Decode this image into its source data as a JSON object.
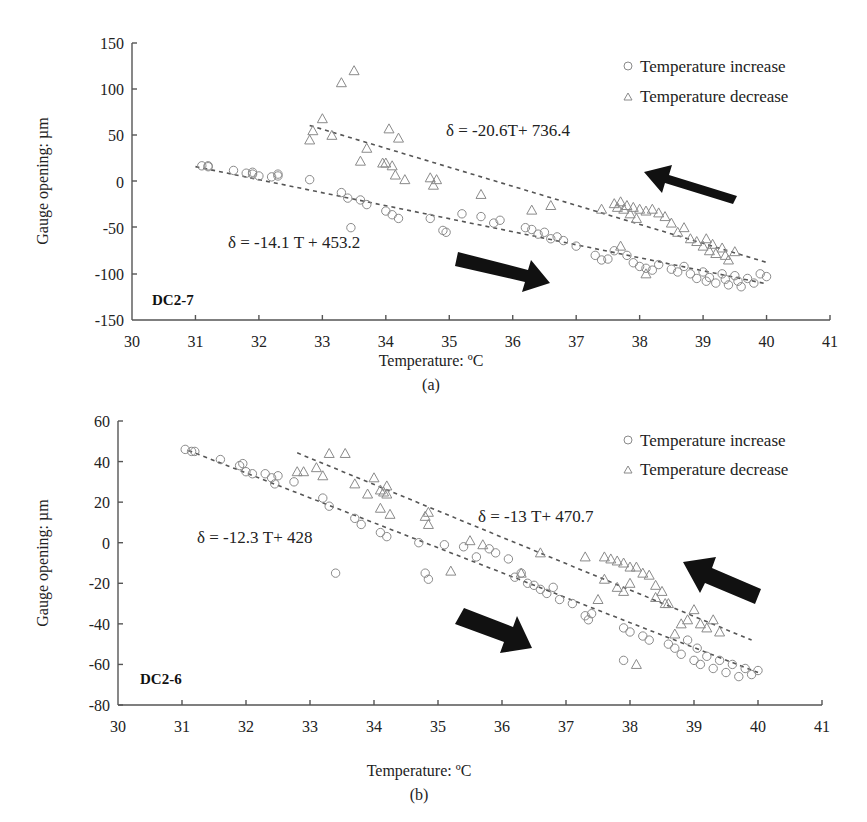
{
  "chart_data": [
    {
      "type": "scatter",
      "panel": "(a)",
      "panel_label": "DC2-7",
      "title": "",
      "xlabel": "Temperature: ºC",
      "ylabel": "Gauge opening: µm",
      "xlim": [
        30,
        41
      ],
      "ylim": [
        -150,
        150
      ],
      "x_ticks": [
        30,
        31,
        32,
        33,
        34,
        35,
        36,
        37,
        38,
        39,
        40,
        41
      ],
      "y_ticks": [
        150,
        100,
        50,
        0,
        -50,
        -100,
        -150
      ],
      "grid": false,
      "legend": {
        "position": "top-right",
        "entries": [
          "Temperature increase",
          "Temperature decrease"
        ]
      },
      "series": [
        {
          "name": "Temperature increase",
          "marker": "circle",
          "trendline": {
            "equation": "δ = -14.1 T + 453.2",
            "slope": -14.1,
            "intercept": 453.2,
            "x_range": [
              31,
              40
            ]
          },
          "points": [
            [
              31.1,
              17
            ],
            [
              31.2,
              16
            ],
            [
              31.2,
              17
            ],
            [
              31.6,
              12
            ],
            [
              31.8,
              9
            ],
            [
              31.9,
              8
            ],
            [
              31.9,
              10
            ],
            [
              32.0,
              6
            ],
            [
              32.2,
              5
            ],
            [
              32.3,
              6
            ],
            [
              32.3,
              8
            ],
            [
              32.8,
              2
            ],
            [
              33.3,
              -12
            ],
            [
              33.4,
              -18
            ],
            [
              33.45,
              -50
            ],
            [
              33.6,
              -20
            ],
            [
              33.7,
              -25
            ],
            [
              34.0,
              -32
            ],
            [
              34.1,
              -36
            ],
            [
              34.2,
              -40
            ],
            [
              34.7,
              -40
            ],
            [
              34.9,
              -53
            ],
            [
              34.95,
              -55
            ],
            [
              35.2,
              -35
            ],
            [
              35.5,
              -38
            ],
            [
              35.7,
              -45
            ],
            [
              35.8,
              -42
            ],
            [
              36.2,
              -50
            ],
            [
              36.3,
              -52
            ],
            [
              36.4,
              -57
            ],
            [
              36.5,
              -55
            ],
            [
              36.6,
              -62
            ],
            [
              36.7,
              -60
            ],
            [
              36.8,
              -64
            ],
            [
              37.0,
              -70
            ],
            [
              37.3,
              -80
            ],
            [
              37.4,
              -85
            ],
            [
              37.5,
              -84
            ],
            [
              37.6,
              -75
            ],
            [
              37.8,
              -80
            ],
            [
              37.9,
              -88
            ],
            [
              38.0,
              -92
            ],
            [
              38.1,
              -94
            ],
            [
              38.2,
              -96
            ],
            [
              38.3,
              -90
            ],
            [
              38.5,
              -95
            ],
            [
              38.6,
              -98
            ],
            [
              38.7,
              -92
            ],
            [
              38.8,
              -100
            ],
            [
              38.9,
              -105
            ],
            [
              39.0,
              -98
            ],
            [
              39.05,
              -108
            ],
            [
              39.1,
              -104
            ],
            [
              39.2,
              -110
            ],
            [
              39.3,
              -100
            ],
            [
              39.35,
              -106
            ],
            [
              39.4,
              -112
            ],
            [
              39.5,
              -102
            ],
            [
              39.55,
              -108
            ],
            [
              39.6,
              -114
            ],
            [
              39.7,
              -105
            ],
            [
              39.8,
              -110
            ],
            [
              39.9,
              -100
            ],
            [
              40.0,
              -103
            ]
          ]
        },
        {
          "name": "Temperature decrease",
          "marker": "triangle",
          "trendline": {
            "equation": "δ = -20.6T+ 736.4",
            "slope": -20.6,
            "intercept": 736.4,
            "x_range": [
              32.8,
              40
            ]
          },
          "points": [
            [
              32.8,
              45
            ],
            [
              32.85,
              55
            ],
            [
              33.0,
              68
            ],
            [
              33.15,
              50
            ],
            [
              33.3,
              107
            ],
            [
              33.5,
              120
            ],
            [
              33.6,
              22
            ],
            [
              33.7,
              36
            ],
            [
              33.95,
              20
            ],
            [
              34.0,
              20
            ],
            [
              34.05,
              57
            ],
            [
              34.1,
              17
            ],
            [
              34.15,
              7
            ],
            [
              34.2,
              47
            ],
            [
              34.3,
              2
            ],
            [
              34.7,
              4
            ],
            [
              34.75,
              -4
            ],
            [
              34.8,
              2
            ],
            [
              35.5,
              -14
            ],
            [
              36.3,
              -31
            ],
            [
              36.6,
              -26
            ],
            [
              37.4,
              -30
            ],
            [
              37.6,
              -24
            ],
            [
              37.65,
              -28
            ],
            [
              37.7,
              -22
            ],
            [
              37.75,
              -30
            ],
            [
              37.8,
              -26
            ],
            [
              37.85,
              -35
            ],
            [
              37.9,
              -28
            ],
            [
              37.95,
              -40
            ],
            [
              38.0,
              -30
            ],
            [
              38.1,
              -32
            ],
            [
              38.2,
              -30
            ],
            [
              38.3,
              -34
            ],
            [
              38.4,
              -38
            ],
            [
              38.5,
              -45
            ],
            [
              38.6,
              -55
            ],
            [
              38.7,
              -50
            ],
            [
              38.8,
              -62
            ],
            [
              38.9,
              -65
            ],
            [
              39.0,
              -70
            ],
            [
              39.05,
              -62
            ],
            [
              39.1,
              -75
            ],
            [
              39.15,
              -68
            ],
            [
              39.2,
              -78
            ],
            [
              39.3,
              -72
            ],
            [
              39.35,
              -80
            ],
            [
              39.4,
              -85
            ],
            [
              39.5,
              -76
            ],
            [
              37.7,
              -70
            ],
            [
              38.1,
              -100
            ]
          ]
        }
      ],
      "annotations": [
        "δ = -20.6T+ 736.4",
        "δ = -14.1 T + 453.2",
        "DC2-7",
        "arrow right (heating)",
        "arrow left (cooling)"
      ]
    },
    {
      "type": "scatter",
      "panel": "(b)",
      "panel_label": "DC2-6",
      "title": "",
      "xlabel": "Temperature: ºC",
      "ylabel": "Gauge opening: µm",
      "xlim": [
        30,
        41
      ],
      "ylim": [
        -80,
        60
      ],
      "x_ticks": [
        30,
        31,
        32,
        33,
        34,
        35,
        36,
        37,
        38,
        39,
        40,
        41
      ],
      "y_ticks": [
        60,
        40,
        20,
        0,
        -20,
        -40,
        -60,
        -80
      ],
      "grid": false,
      "legend": {
        "position": "top-right",
        "entries": [
          "Temperature increase",
          "Temperature decrease"
        ]
      },
      "series": [
        {
          "name": "Temperature increase",
          "marker": "circle",
          "trendline": {
            "equation": "δ = -12.3 T+ 428",
            "slope": -12.3,
            "intercept": 428,
            "x_range": [
              31.1,
              40
            ]
          },
          "points": [
            [
              31.05,
              46
            ],
            [
              31.15,
              45
            ],
            [
              31.2,
              45
            ],
            [
              31.6,
              41
            ],
            [
              31.9,
              38
            ],
            [
              31.95,
              39
            ],
            [
              32.0,
              35
            ],
            [
              32.1,
              34
            ],
            [
              32.3,
              34
            ],
            [
              32.4,
              32
            ],
            [
              32.45,
              29
            ],
            [
              32.5,
              33
            ],
            [
              32.75,
              30
            ],
            [
              33.2,
              22
            ],
            [
              33.3,
              18
            ],
            [
              33.4,
              -15
            ],
            [
              33.7,
              12
            ],
            [
              33.8,
              9
            ],
            [
              34.1,
              5
            ],
            [
              34.2,
              3
            ],
            [
              34.7,
              0
            ],
            [
              34.8,
              -15
            ],
            [
              34.85,
              -18
            ],
            [
              35.1,
              -1
            ],
            [
              35.4,
              -2
            ],
            [
              35.6,
              -7
            ],
            [
              35.8,
              -3
            ],
            [
              35.9,
              -5
            ],
            [
              36.1,
              -8
            ],
            [
              36.2,
              -17
            ],
            [
              36.3,
              -15
            ],
            [
              36.4,
              -20
            ],
            [
              36.5,
              -21
            ],
            [
              36.6,
              -23
            ],
            [
              36.7,
              -25
            ],
            [
              36.8,
              -22
            ],
            [
              36.9,
              -28
            ],
            [
              37.1,
              -30
            ],
            [
              37.3,
              -36
            ],
            [
              37.35,
              -38
            ],
            [
              37.4,
              -35
            ],
            [
              37.9,
              -42
            ],
            [
              38.0,
              -44
            ],
            [
              38.2,
              -46
            ],
            [
              38.3,
              -48
            ],
            [
              38.6,
              -50
            ],
            [
              38.7,
              -52
            ],
            [
              38.8,
              -55
            ],
            [
              38.9,
              -48
            ],
            [
              39.0,
              -58
            ],
            [
              39.05,
              -52
            ],
            [
              39.1,
              -60
            ],
            [
              39.2,
              -56
            ],
            [
              39.3,
              -62
            ],
            [
              39.4,
              -58
            ],
            [
              39.5,
              -64
            ],
            [
              39.6,
              -60
            ],
            [
              39.7,
              -66
            ],
            [
              39.8,
              -62
            ],
            [
              39.9,
              -65
            ],
            [
              40.0,
              -63
            ],
            [
              37.9,
              -58
            ]
          ]
        },
        {
          "name": "Temperature decrease",
          "marker": "triangle",
          "trendline": {
            "equation": "δ = -13 T+ 470.7",
            "slope": -13,
            "intercept": 470.7,
            "x_range": [
              32.8,
              39.9
            ]
          },
          "points": [
            [
              32.8,
              35
            ],
            [
              32.9,
              35
            ],
            [
              33.1,
              37
            ],
            [
              33.2,
              33
            ],
            [
              33.3,
              44
            ],
            [
              33.55,
              44
            ],
            [
              33.7,
              29
            ],
            [
              33.9,
              24
            ],
            [
              34.0,
              32
            ],
            [
              34.1,
              26
            ],
            [
              34.15,
              25
            ],
            [
              34.2,
              24
            ],
            [
              34.2,
              28
            ],
            [
              34.1,
              17
            ],
            [
              34.25,
              14
            ],
            [
              34.8,
              13
            ],
            [
              34.85,
              9
            ],
            [
              34.85,
              15
            ],
            [
              35.2,
              -14
            ],
            [
              35.5,
              1
            ],
            [
              35.7,
              -1
            ],
            [
              36.3,
              -15
            ],
            [
              36.6,
              -5
            ],
            [
              37.3,
              -7
            ],
            [
              37.6,
              -7
            ],
            [
              37.7,
              -8
            ],
            [
              37.8,
              -9
            ],
            [
              37.9,
              -10
            ],
            [
              38.0,
              -12
            ],
            [
              38.1,
              -12
            ],
            [
              38.2,
              -15
            ],
            [
              38.3,
              -16
            ],
            [
              38.4,
              -21
            ],
            [
              38.5,
              -24
            ],
            [
              38.55,
              -30
            ],
            [
              37.6,
              -18
            ],
            [
              37.8,
              -22
            ],
            [
              37.9,
              -24
            ],
            [
              38.0,
              -20
            ],
            [
              38.7,
              -45
            ],
            [
              38.8,
              -40
            ],
            [
              38.9,
              -38
            ],
            [
              39.0,
              -33
            ],
            [
              39.1,
              -40
            ],
            [
              39.2,
              -42
            ],
            [
              39.3,
              -38
            ],
            [
              39.4,
              -44
            ],
            [
              38.4,
              -27
            ],
            [
              38.6,
              -30
            ],
            [
              38.1,
              -60
            ],
            [
              37.5,
              -28
            ]
          ]
        }
      ],
      "annotations": [
        "δ = -13 T+ 470.7",
        "δ = -12.3 T+ 428",
        "DC2-6",
        "arrow right (heating)",
        "arrow left (cooling)"
      ]
    }
  ],
  "chart_a": {
    "caption": "(a)",
    "panel_label": "DC2-7",
    "xlabel": "Temperature: ºC",
    "ylabel": "Gauge opening: µm",
    "eq_decrease": "δ = -20.6T+ 736.4",
    "eq_increase": "δ = -14.1 T + 453.2",
    "legend_increase": "Temperature increase",
    "legend_decrease": "Temperature decrease",
    "x_ticks": [
      "30",
      "31",
      "32",
      "33",
      "34",
      "35",
      "36",
      "37",
      "38",
      "39",
      "40",
      "41"
    ],
    "y_ticks": [
      "150",
      "100",
      "50",
      "0",
      "-50",
      "-100",
      "-150"
    ]
  },
  "chart_b": {
    "caption": "(b)",
    "panel_label": "DC2-6",
    "xlabel": "Temperature: ºC",
    "ylabel": "Gauge opening: µm",
    "eq_decrease": "δ = -13 T+ 470.7",
    "eq_increase": "δ = -12.3 T+ 428",
    "legend_increase": "Temperature increase",
    "legend_decrease": "Temperature decrease",
    "x_ticks": [
      "30",
      "31",
      "32",
      "33",
      "34",
      "35",
      "36",
      "37",
      "38",
      "39",
      "40",
      "41"
    ],
    "y_ticks": [
      "60",
      "40",
      "20",
      "0",
      "-20",
      "-40",
      "-60",
      "-80"
    ]
  }
}
